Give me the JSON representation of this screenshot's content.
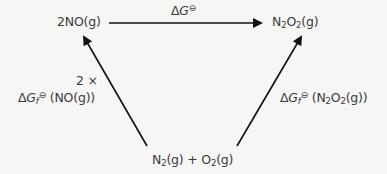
{
  "diagram": {
    "type": "thermodynamic-cycle",
    "nodes": {
      "top_left": {
        "text": "2NO(g)",
        "coef": "2",
        "species": "NO",
        "state": "(g)"
      },
      "top_right": {
        "text": "N2O2(g)",
        "el1": "N",
        "sub1": "2",
        "el2": "O",
        "sub2": "2",
        "state": "(g)"
      },
      "bottom": {
        "text": "N2(g) + O2(g)",
        "el1": "N",
        "sub1": "2",
        "state1": "(g)",
        "plus": "+",
        "el2": "O",
        "sub2": "2",
        "state2": "(g)"
      }
    },
    "arrows": {
      "top": {
        "from": "top_left",
        "to": "top_right",
        "label_delta": "Δ",
        "label_var": "G",
        "label_std": "⊖"
      },
      "left": {
        "from": "bottom",
        "to": "top_left",
        "line1": "2 ×",
        "label_delta": "Δ",
        "label_var": "G",
        "label_sub": "f",
        "label_std": "⊖",
        "label_arg": " (NO(g))"
      },
      "right": {
        "from": "bottom",
        "to": "top_right",
        "label_delta": "Δ",
        "label_var": "G",
        "label_sub": "f",
        "label_std": "⊖",
        "label_arg_open": " (N",
        "label_arg_sub1": "2",
        "label_arg_mid": "O",
        "label_arg_sub2": "2",
        "label_arg_close": "(g))"
      }
    },
    "colors": {
      "background": "#f6f6f5",
      "arrow": "#111111",
      "text": "#3a3a3a"
    }
  }
}
